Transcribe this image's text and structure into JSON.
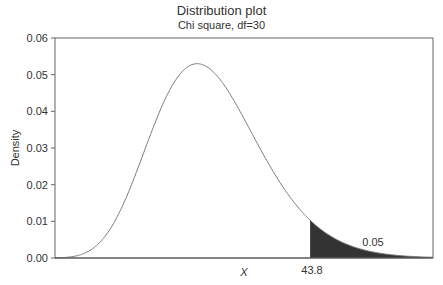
{
  "chart_data": {
    "type": "area",
    "title": "Distribution plot",
    "subtitle": "Chi square, df=30",
    "distribution": "chi-square",
    "df": 30,
    "xlabel": "X",
    "ylabel": "Density",
    "ylim": [
      0,
      0.06
    ],
    "xlim": [
      8.1,
      61
    ],
    "yticks": [
      0.0,
      0.01,
      0.02,
      0.03,
      0.04,
      0.05,
      0.06
    ],
    "ytick_labels": [
      "0.00",
      "0.01",
      "0.02",
      "0.03",
      "0.04",
      "0.05",
      "0.06"
    ],
    "xticks": [
      43.8
    ],
    "xtick_labels": [
      "43.8"
    ],
    "critical_value": 43.8,
    "shaded_region": {
      "from": 43.8,
      "to": "right tail",
      "area": 0.05,
      "label": "0.05",
      "color": "#333333"
    },
    "peak": {
      "x": 28,
      "y": 0.0523
    },
    "grid": false,
    "legend": "none",
    "curve_color": "#7a7a7a"
  }
}
